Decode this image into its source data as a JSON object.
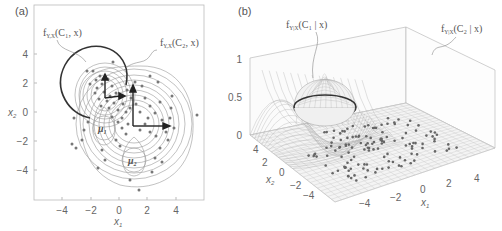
{
  "figure": {
    "panel_a": {
      "label": "(a)",
      "xlabel": "x",
      "xlabel_sub": "1",
      "ylabel": "x",
      "ylabel_sub": "2",
      "xticks": [
        "−4",
        "−2",
        "0",
        "2",
        "4"
      ],
      "yticks": [
        "4",
        "2",
        "0",
        "−2",
        "−4"
      ],
      "annotation_c1": "f",
      "annotation_c1_sub": "Y,X",
      "annotation_c1_args": "(C₁, x)",
      "annotation_c2": "f",
      "annotation_c2_sub": "Y,X",
      "annotation_c2_args": "(C₂, x)",
      "mu1": "μ",
      "mu1_sub": "1",
      "mu2": "μ",
      "mu2_sub": "2"
    },
    "panel_b": {
      "label": "(b)",
      "zticks": [
        "1",
        "0.5",
        "0"
      ],
      "x1ticks": [
        "−4",
        "−2",
        "0",
        "2",
        "4"
      ],
      "x2ticks": [
        "4",
        "2",
        "0",
        "−2",
        "−4"
      ],
      "xlabel": "x",
      "xlabel_sub": "1",
      "ylabel": "x",
      "ylabel_sub": "2",
      "annotation_c1": "f",
      "annotation_c1_sub": "Y|X",
      "annotation_c1_args": "(C₁ | x)",
      "annotation_c2": "f",
      "annotation_c2_sub": "Y|X",
      "annotation_c2_args": "(C₂ | x)"
    }
  },
  "chart_data": [
    {
      "type": "scatter",
      "title": "(a) Joint densities f_{Y,X}(C, x) contours with class means μ1, μ2",
      "xlabel": "x1",
      "ylabel": "x2",
      "xlim": [
        -6,
        6
      ],
      "ylim": [
        -6,
        6
      ],
      "xticks": [
        -4,
        -2,
        0,
        2,
        4
      ],
      "yticks": [
        -4,
        -2,
        0,
        2,
        4
      ],
      "series": [
        {
          "name": "class C1 mean",
          "x": [
            -1
          ],
          "y": [
            -1
          ]
        },
        {
          "name": "class C2 mean",
          "x": [
            1
          ],
          "y": [
            -3
          ]
        }
      ],
      "annotations": [
        "f_{Y,X}(C1, x)",
        "f_{Y,X}(C2, x)",
        "μ1",
        "μ2"
      ],
      "grid": false
    },
    {
      "type": "surface",
      "title": "(b) Posterior f_{Y|X}(C1|x), f_{Y|X}(C2|x)",
      "xlabel": "x1",
      "ylabel": "x2",
      "zlabel": "",
      "xlim": [
        -6,
        6
      ],
      "ylim": [
        -6,
        6
      ],
      "zlim": [
        0,
        1
      ],
      "xticks": [
        -4,
        -2,
        0,
        2,
        4
      ],
      "yticks": [
        -4,
        -2,
        0,
        2,
        4
      ],
      "zticks": [
        0,
        0.5,
        1
      ],
      "annotations": [
        "f_{Y|X}(C1 | x)",
        "f_{Y|X}(C2 | x)"
      ],
      "grid": true
    }
  ]
}
